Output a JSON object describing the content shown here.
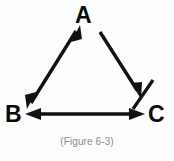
{
  "figure": {
    "caption": "(Figure 6-3)",
    "background_color": "#fdfdfd",
    "stroke_color": "#111111",
    "caption_color": "#8d8d8d"
  },
  "nodes": [
    {
      "id": "A",
      "label": "A",
      "x": 85,
      "y": 16
    },
    {
      "id": "B",
      "label": "B",
      "x": 14,
      "y": 115
    },
    {
      "id": "C",
      "label": "C",
      "x": 157,
      "y": 115
    }
  ],
  "edges": [
    {
      "id": "edge-a-b",
      "from": "A",
      "to": "B",
      "arrowheads": "both",
      "x1": 78,
      "y1": 33,
      "x2": 29,
      "y2": 101
    },
    {
      "id": "edge-a-c",
      "from": "A",
      "to": "C",
      "arrowheads": "end",
      "x1": 99,
      "y1": 33,
      "x2": 139,
      "y2": 94
    },
    {
      "id": "edge-b-c",
      "from": "B",
      "to": "C",
      "arrowheads": "both",
      "x1": 28,
      "y1": 114,
      "x2": 143,
      "y2": 114
    }
  ],
  "annotations": [
    {
      "id": "slash-mark-near-c",
      "type": "slash",
      "x1": 133,
      "y1": 109,
      "x2": 153,
      "y2": 80
    }
  ]
}
